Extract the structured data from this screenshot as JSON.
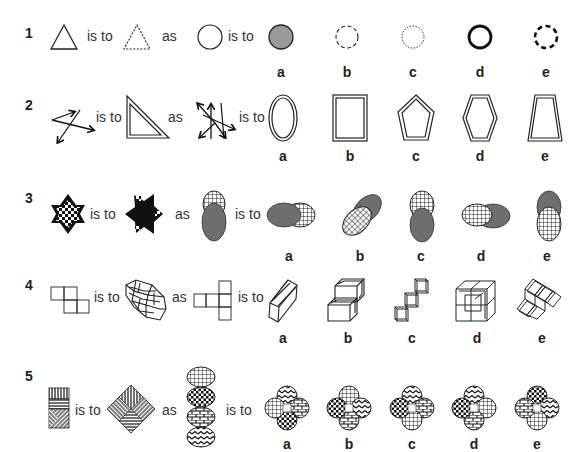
{
  "words": {
    "is_to": "is to",
    "as": "as"
  },
  "questions": [
    {
      "number": "1",
      "stem": [
        "triangle-solid-outline",
        "triangle-dashed-outline",
        "circle-solid-outline"
      ],
      "options": [
        {
          "label": "a",
          "figure": "circle-gray-filled"
        },
        {
          "label": "b",
          "figure": "circle-long-dashed"
        },
        {
          "label": "c",
          "figure": "circle-short-dashed"
        },
        {
          "label": "d",
          "figure": "circle-thick-outline"
        },
        {
          "label": "e",
          "figure": "circle-thick-dashed"
        }
      ]
    },
    {
      "number": "2",
      "stem": [
        "three-arrows",
        "double-line-right-triangle",
        "six-arrows"
      ],
      "options": [
        {
          "label": "a",
          "figure": "double-line-oval"
        },
        {
          "label": "b",
          "figure": "double-line-rectangle"
        },
        {
          "label": "c",
          "figure": "double-line-pentagon"
        },
        {
          "label": "d",
          "figure": "double-line-hexagon"
        },
        {
          "label": "e",
          "figure": "double-line-trapezoid"
        }
      ]
    },
    {
      "number": "3",
      "stem": [
        "checkered-star",
        "black-star-rotated",
        "gray-oval-over-grid-oval"
      ],
      "options": [
        {
          "label": "a",
          "figure": "gray-oval-left-grid-right"
        },
        {
          "label": "b",
          "figure": "grid-oval-over-gray-diagonal"
        },
        {
          "label": "c",
          "figure": "gray-oval-bottom-grid-top"
        },
        {
          "label": "d",
          "figure": "grid-oval-left-gray-right"
        },
        {
          "label": "e",
          "figure": "grid-oval-bottom-gray-top"
        }
      ]
    },
    {
      "number": "4",
      "stem": [
        "net-four-squares",
        "wireframe-cube-stack",
        "net-five-squares"
      ],
      "options": [
        {
          "label": "a",
          "figure": "wireframe-box"
        },
        {
          "label": "b",
          "figure": "wireframe-stair-cubes"
        },
        {
          "label": "c",
          "figure": "wireframe-diagonal-cubes"
        },
        {
          "label": "d",
          "figure": "wireframe-cube-cluster"
        },
        {
          "label": "e",
          "figure": "wireframe-tilted-cluster"
        }
      ]
    },
    {
      "number": "5",
      "stem": [
        "striped-rectangle",
        "striped-diamond",
        "four-patterned-ovals-stack"
      ],
      "options": [
        {
          "label": "a",
          "figure": "clover-wave-brick-dots-grid"
        },
        {
          "label": "b",
          "figure": "clover-grid-wave-brick-dots"
        },
        {
          "label": "c",
          "figure": "clover-wave-brick-grid-dots"
        },
        {
          "label": "d",
          "figure": "clover-wave-grid-brick-dots"
        },
        {
          "label": "e",
          "figure": "clover-dots-wave-grid-brick"
        }
      ]
    }
  ],
  "colors": {
    "ink": "#222222",
    "gray_fill": "#8a8a8a",
    "dark_gray_fill": "#6e6e6e"
  }
}
